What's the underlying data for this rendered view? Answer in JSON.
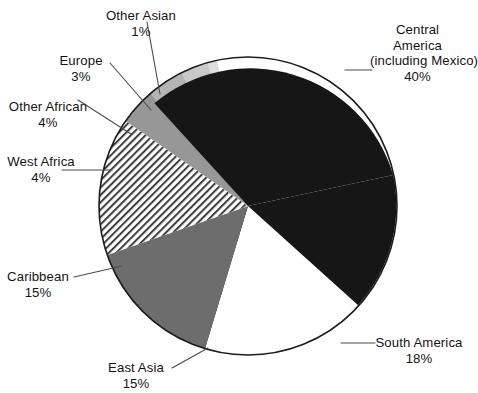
{
  "chart_data": {
    "type": "pie",
    "title": "",
    "subtitle": "",
    "xlabel": "",
    "ylabel": "",
    "legend_position": "none",
    "grid": false,
    "units": "percent",
    "total": 100,
    "categories": [
      "Central America (including Mexico)",
      "South America",
      "East Asia",
      "Caribbean",
      "West Africa",
      "Other African",
      "Europe",
      "Other Asian"
    ],
    "values": [
      40,
      18,
      15,
      15,
      4,
      4,
      3,
      1
    ],
    "slices": [
      {
        "name": "Central America (including Mexico)",
        "value": 40,
        "percent_label": "40%",
        "fill": "#161616",
        "pattern": "solid",
        "start_deg": -12,
        "end_deg": 132
      },
      {
        "name": "South America",
        "value": 18,
        "percent_label": "18%",
        "fill": "#ffffff",
        "pattern": "solid",
        "start_deg": 132,
        "end_deg": 196.8
      },
      {
        "name": "East Asia",
        "value": 15,
        "percent_label": "15%",
        "fill": "#6d6d6d",
        "pattern": "solid",
        "start_deg": 196.8,
        "end_deg": 250.8
      },
      {
        "name": "Caribbean",
        "value": 15,
        "percent_label": "15%",
        "fill": "#ffffff",
        "pattern": "diagonal-hatch",
        "start_deg": 250.8,
        "end_deg": 304.8
      },
      {
        "name": "West Africa",
        "value": 4,
        "percent_label": "4%",
        "fill": "#979797",
        "pattern": "solid",
        "start_deg": 304.8,
        "end_deg": 319.2
      },
      {
        "name": "Other African",
        "value": 4,
        "percent_label": "4%",
        "fill": "#b4b4b4",
        "pattern": "solid",
        "start_deg": 319.2,
        "end_deg": 333.6
      },
      {
        "name": "Europe",
        "value": 3,
        "percent_label": "3%",
        "fill": "#c9c9c9",
        "pattern": "solid",
        "start_deg": 333.6,
        "end_deg": 344.4
      },
      {
        "name": "Other Asian",
        "value": 1,
        "percent_label": "1%",
        "fill": "#dddddd",
        "pattern": "solid",
        "start_deg": 344.4,
        "end_deg": 348
      }
    ]
  },
  "labels": {
    "central_america": {
      "line1": "Central",
      "line2": "America",
      "line3": "(including Mexico)",
      "percent": "40%"
    },
    "south_america": {
      "line1": "South America",
      "percent": "18%"
    },
    "east_asia": {
      "line1": "East Asia",
      "percent": "15%"
    },
    "caribbean": {
      "line1": "Caribbean",
      "percent": "15%"
    },
    "west_africa": {
      "line1": "West Africa",
      "percent": "4%"
    },
    "other_african": {
      "line1": "Other African",
      "percent": "4%"
    },
    "europe": {
      "line1": "Europe",
      "percent": "3%"
    },
    "other_asian": {
      "line1": "Other Asian",
      "percent": "1%"
    }
  },
  "colors": {
    "background": "#ffffff",
    "outline": "#1c1c1c",
    "text": "#141414",
    "leader_line": "#4a4a4a",
    "slice_black": "#161616",
    "slice_white": "#ffffff",
    "slice_dark_gray": "#6d6d6d",
    "slice_mid_gray": "#979797",
    "slice_light_gray": "#b4b4b4",
    "slice_lighter_gray": "#c9c9c9",
    "slice_lightest_gray": "#dddddd"
  },
  "geometry": {
    "center_x": 248,
    "center_y": 206,
    "radius": 149
  }
}
